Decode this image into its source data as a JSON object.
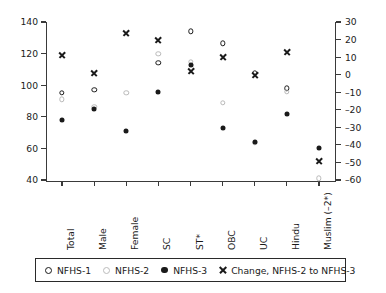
{
  "chart_data": {
    "type": "scatter",
    "title": "",
    "subtitle": "",
    "xlabel": "",
    "ylabel": "",
    "categories": [
      "Total",
      "Male",
      "Female",
      "SC",
      "ST*",
      "OBC",
      "UC",
      "Hindu",
      "Muslim (–2*)"
    ],
    "left_axis": {
      "label": "",
      "ylim": [
        40,
        140
      ],
      "ticks": [
        40,
        60,
        80,
        100,
        120,
        140
      ],
      "tick_labels": [
        "40",
        "60",
        "80",
        "100",
        "120",
        "140"
      ]
    },
    "right_axis": {
      "label": "",
      "ylim": [
        -60,
        30
      ],
      "ticks": [
        -60,
        -50,
        -40,
        -30,
        -20,
        -10,
        0,
        10,
        20,
        30
      ],
      "tick_labels": [
        "–60",
        "–50",
        "–40",
        "–30",
        "–20",
        "–10",
        "0",
        "10",
        "20",
        "30"
      ]
    },
    "grid": false,
    "legend_position": "bottom",
    "series": [
      {
        "name": "NFHS-1",
        "marker": "open-circle",
        "axis": "left",
        "values": [
          95,
          97,
          null,
          114,
          134,
          126.5,
          108,
          98,
          null
        ]
      },
      {
        "name": "NFHS-2",
        "marker": "light-circle",
        "axis": "left",
        "values": [
          91,
          86.5,
          95,
          120,
          115,
          89,
          63.5,
          96,
          41
        ]
      },
      {
        "name": "NFHS-3",
        "marker": "filled-circle",
        "axis": "left",
        "values": [
          78,
          85,
          71,
          96,
          113,
          73,
          64,
          82,
          60
        ]
      },
      {
        "name": "Change, NFHS-2 to NFHS-3",
        "marker": "x-cross",
        "axis": "right",
        "values": [
          11,
          1,
          24,
          20,
          2,
          10,
          0,
          13,
          -49
        ]
      }
    ]
  },
  "legend": {
    "entries": [
      {
        "label": "NFHS-1",
        "marker": "open-circle"
      },
      {
        "label": "NFHS-2",
        "marker": "light-circle"
      },
      {
        "label": "NFHS-3",
        "marker": "filled-circle"
      },
      {
        "label": "Change, NFHS-2 to NFHS-3",
        "marker": "x-cross"
      }
    ]
  }
}
